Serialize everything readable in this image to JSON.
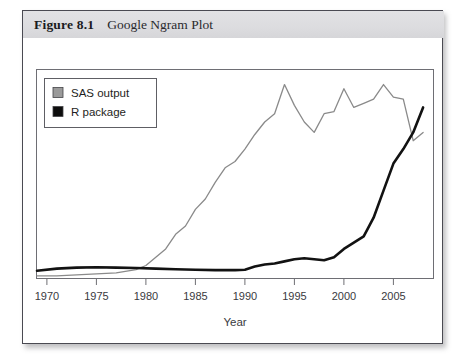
{
  "figure": {
    "number_label": "Figure 8.1",
    "title": "Google Ngram Plot"
  },
  "chart_data": {
    "type": "line",
    "title": "Google Ngram Plot",
    "xlabel": "Year",
    "ylabel": "",
    "xlim": [
      1969,
      2009
    ],
    "ylim": [
      0,
      1
    ],
    "grid": false,
    "legend_position": "top-left",
    "xticks": [
      "1970",
      "1975",
      "1980",
      "1985",
      "1990",
      "1995",
      "2000",
      "2005"
    ],
    "xtick_values": [
      1970,
      1975,
      1980,
      1985,
      1990,
      1995,
      2000,
      2005
    ],
    "yticks": [],
    "series": [
      {
        "name": "SAS output",
        "color": "#8a8a8a",
        "marker": "square",
        "x": [
          1969,
          1971,
          1973,
          1975,
          1977,
          1979,
          1980,
          1981,
          1982,
          1983,
          1984,
          1985,
          1986,
          1987,
          1988,
          1989,
          1990,
          1991,
          1992,
          1993,
          1994,
          1995,
          1996,
          1997,
          1998,
          1999,
          2000,
          2001,
          2002,
          2003,
          2004,
          2005,
          2006,
          2007,
          2008
        ],
        "y": [
          0.01,
          0.01,
          0.015,
          0.02,
          0.025,
          0.04,
          0.06,
          0.1,
          0.14,
          0.21,
          0.25,
          0.33,
          0.38,
          0.46,
          0.53,
          0.56,
          0.62,
          0.69,
          0.75,
          0.79,
          0.93,
          0.83,
          0.75,
          0.7,
          0.79,
          0.8,
          0.91,
          0.82,
          0.84,
          0.86,
          0.93,
          0.87,
          0.86,
          0.66,
          0.7
        ]
      },
      {
        "name": "R package",
        "color": "#121212",
        "marker": "square",
        "x": [
          1969,
          1971,
          1973,
          1975,
          1977,
          1979,
          1981,
          1983,
          1985,
          1987,
          1989,
          1990,
          1991,
          1992,
          1993,
          1994,
          1995,
          1996,
          1997,
          1998,
          1999,
          2000,
          2001,
          2002,
          2003,
          2004,
          2005,
          2006,
          2007,
          2008
        ],
        "y": [
          0.035,
          0.045,
          0.05,
          0.052,
          0.05,
          0.048,
          0.045,
          0.042,
          0.04,
          0.038,
          0.038,
          0.04,
          0.055,
          0.065,
          0.07,
          0.08,
          0.09,
          0.095,
          0.09,
          0.085,
          0.1,
          0.14,
          0.17,
          0.2,
          0.29,
          0.42,
          0.55,
          0.62,
          0.7,
          0.82
        ]
      }
    ]
  },
  "legend": {
    "entries": [
      {
        "label": "SAS output",
        "swatch_color": "#9a9a9a"
      },
      {
        "label": "R package",
        "swatch_color": "#0d0d0d"
      }
    ]
  },
  "colors": {
    "card_border": "#4a4a52",
    "caption_background": "#dcdcdf",
    "plot_background": "#ffffff",
    "frame": "#6e6e74",
    "sas_line": "#8a8a8a",
    "r_line": "#121212"
  }
}
